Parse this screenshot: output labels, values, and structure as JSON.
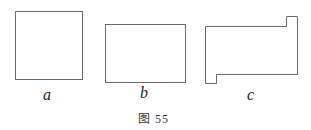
{
  "figure": {
    "caption": "图 55",
    "shapes": [
      {
        "id": "a",
        "label": "a",
        "type": "square"
      },
      {
        "id": "b",
        "label": "b",
        "type": "rectangle"
      },
      {
        "id": "c",
        "label": "c",
        "type": "rectangle with notches"
      }
    ]
  }
}
